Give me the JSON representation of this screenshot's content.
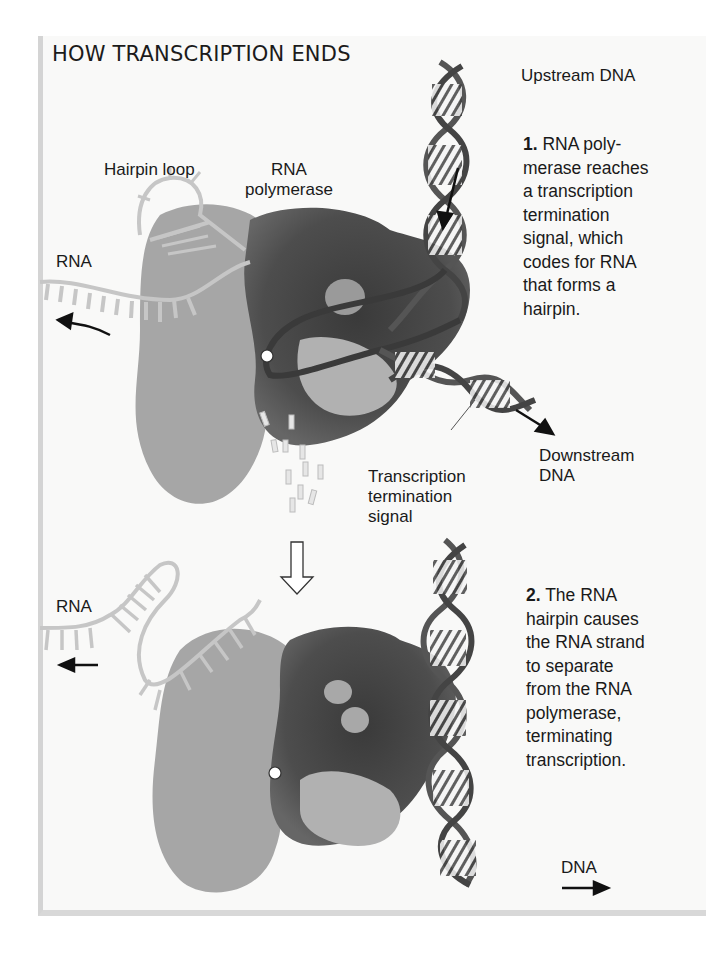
{
  "figure": {
    "title": "HOW TRANSCRIPTION ENDS",
    "panel1": {
      "labels": {
        "upstream_dna": "Upstream DNA",
        "hairpin_loop": "Hairpin loop",
        "rna_polymerase_line1": "RNA",
        "rna_polymerase_line2": "polymerase",
        "rna": "RNA",
        "downstream_dna_line1": "Downstream",
        "downstream_dna_line2": "DNA",
        "termination_signal_line1": "Transcription",
        "termination_signal_line2": "termination",
        "termination_signal_line3": "signal"
      },
      "step_number": "1.",
      "step_text_lines": [
        "RNA poly-",
        "merase reaches",
        "a transcription",
        "termination",
        "signal, which",
        "codes for RNA",
        "that forms a",
        "hairpin."
      ]
    },
    "panel2": {
      "labels": {
        "rna": "RNA",
        "dna": "DNA"
      },
      "step_number": "2.",
      "step_text_lines": [
        "The RNA",
        "hairpin causes",
        "the RNA strand",
        "to separate",
        "from the RNA",
        "polymerase,",
        "terminating",
        "transcription."
      ]
    },
    "colors": {
      "background": "#f9f9f8",
      "polymerase_light": "#a9a9a9",
      "polymerase_dark": "#4a4a4a",
      "rna_strand": "#c8c8c8",
      "dna_strand": "#555555",
      "text": "#1a1a1a"
    }
  }
}
